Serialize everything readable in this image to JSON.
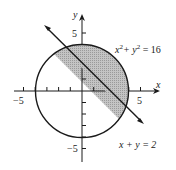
{
  "diagram": {
    "axes": {
      "x_label": "x",
      "y_label": "y",
      "x_ticks": [
        -5,
        -4,
        -3,
        -2,
        -1,
        1,
        2,
        3,
        4,
        5
      ],
      "y_ticks": [
        -5,
        -4,
        -3,
        -2,
        -1,
        1,
        2,
        3,
        4,
        5
      ],
      "x_tick_labels": {
        "neg": "−5",
        "pos": "5"
      },
      "y_tick_labels": {
        "neg": "−5",
        "pos": "5"
      }
    },
    "circle": {
      "equation_base": "x",
      "equation_mid": "+ y",
      "equation_end": " = 16",
      "sup": "2",
      "radius": 4
    },
    "line": {
      "equation": "x + y = 2"
    },
    "shaded_region": "region inside circle above line x + y = 2",
    "colors": {
      "stroke": "#1a1a1a",
      "shade": "#b8b8b8"
    }
  }
}
